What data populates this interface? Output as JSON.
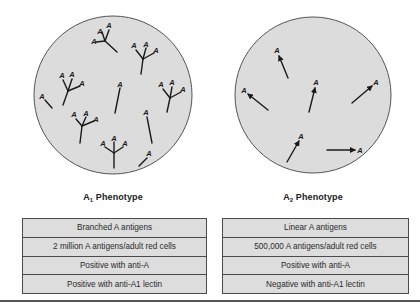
{
  "colors": {
    "circle_fill": "#dcdcdc",
    "circle_stroke": "#555555",
    "table_fill": "#dddddd",
    "table_border": "#4a4a4a",
    "glyph": "#1a1a1a"
  },
  "panels": [
    {
      "id": "a1",
      "label_main": "A",
      "label_sub": "1",
      "label_rest": " Phenotype",
      "antigen_letter": "A",
      "antigen_structure": "branched",
      "properties": [
        "Branched A antigens",
        "2 million A antigens/adult red cells",
        "Positive with anti-A",
        "Positive with anti-A1 lectin"
      ]
    },
    {
      "id": "a2",
      "label_main": "A",
      "label_sub": "2",
      "label_rest": " Phenotype",
      "antigen_letter": "A",
      "antigen_structure": "linear",
      "properties": [
        "Linear A antigens",
        "500,000 A antigens/adult red cells",
        "Positive with anti-A",
        "Negative with anti-A1 lectin"
      ]
    }
  ]
}
